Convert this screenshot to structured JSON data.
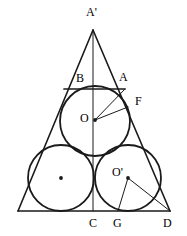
{
  "figure": {
    "type": "geometry-diagram",
    "width": 187,
    "height": 236,
    "stroke_color": "#1a1a1a",
    "fill_color": "#ffffff",
    "background_color": "#ffffff",
    "label_color": "#000000"
  },
  "labels": [
    {
      "id": "A-prime",
      "text": "A'",
      "x": 86,
      "y": 6
    },
    {
      "id": "B",
      "text": "B",
      "x": 76,
      "y": 72
    },
    {
      "id": "A",
      "text": "A",
      "x": 119,
      "y": 71
    },
    {
      "id": "F",
      "text": "F",
      "x": 135,
      "y": 95
    },
    {
      "id": "O",
      "text": "O",
      "x": 80,
      "y": 112
    },
    {
      "id": "O-prime",
      "text": "O'",
      "x": 112,
      "y": 166
    },
    {
      "id": "C",
      "text": "C",
      "x": 89,
      "y": 217
    },
    {
      "id": "G",
      "text": "G",
      "x": 113,
      "y": 217
    },
    {
      "id": "D",
      "text": "D",
      "x": 163,
      "y": 217
    }
  ],
  "points": {
    "apex": {
      "name": "A'",
      "x": 93,
      "y": 30
    },
    "base_left": {
      "name": "left-vertex",
      "x": 18,
      "y": 211
    },
    "base_right": {
      "name": "D",
      "x": 170,
      "y": 211
    },
    "C": {
      "name": "C",
      "x": 93,
      "y": 211
    },
    "G": {
      "name": "G",
      "x": 118,
      "y": 211
    },
    "B": {
      "name": "B",
      "x": 64,
      "y": 89
    },
    "A": {
      "name": "A",
      "x": 125,
      "y": 89
    },
    "F": {
      "name": "F",
      "x": 127,
      "y": 107
    },
    "O": {
      "name": "O",
      "x": 95,
      "y": 120
    },
    "O_prime": {
      "name": "O'",
      "x": 128,
      "y": 178
    },
    "left_circle_center": {
      "name": "left-circle-center",
      "x": 61,
      "y": 178
    }
  },
  "circles": [
    {
      "id": "top-circle",
      "cx": 95,
      "cy": 121,
      "r": 35,
      "center_dot": false
    },
    {
      "id": "bottom-left-circle",
      "cx": 61,
      "cy": 178,
      "r": 33,
      "center_dot": true
    },
    {
      "id": "bottom-right-circle",
      "cx": 128,
      "cy": 178,
      "r": 33,
      "center_dot": true
    }
  ],
  "segments": [
    {
      "id": "triangle-left-side",
      "x1": 93,
      "y1": 30,
      "x2": 18,
      "y2": 211
    },
    {
      "id": "triangle-right-side",
      "x1": 93,
      "y1": 30,
      "x2": 170,
      "y2": 211
    },
    {
      "id": "triangle-base",
      "x1": 18,
      "y1": 211,
      "x2": 170,
      "y2": 211
    },
    {
      "id": "axis-of-symmetry",
      "x1": 93,
      "y1": 30,
      "x2": 93,
      "y2": 211
    },
    {
      "id": "chord-BA",
      "x1": 64,
      "y1": 89,
      "x2": 125,
      "y2": 89
    },
    {
      "id": "radius-OA",
      "x1": 95,
      "y1": 120,
      "x2": 125,
      "y2": 89
    },
    {
      "id": "radius-OF",
      "x1": 95,
      "y1": 120,
      "x2": 128,
      "y2": 107
    },
    {
      "id": "radius-Oprime-G",
      "x1": 128,
      "y1": 178,
      "x2": 118,
      "y2": 211
    },
    {
      "id": "radius-Oprime-D",
      "x1": 128,
      "y1": 178,
      "x2": 170,
      "y2": 211
    }
  ]
}
